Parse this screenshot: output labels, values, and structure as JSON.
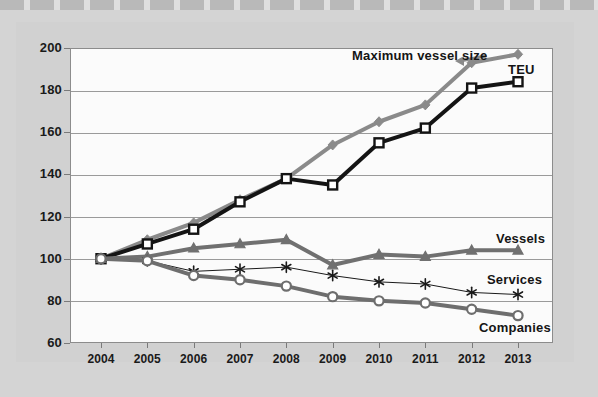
{
  "figure": {
    "annotations": [
      {
        "text": "Maximum vessel size",
        "x": 352,
        "y": 48
      },
      {
        "text": "TEU",
        "x": 508,
        "y": 62
      },
      {
        "text": "Vessels",
        "x": 496,
        "y": 231
      },
      {
        "text": "Services",
        "x": 487,
        "y": 272
      },
      {
        "text": "Companies",
        "x": 479,
        "y": 320
      }
    ]
  },
  "chart_data": {
    "type": "line",
    "title": "",
    "subtitle": "",
    "xlabel": "",
    "ylabel": "",
    "grid": true,
    "legend_position": "inline-annotations",
    "x": [
      2004,
      2005,
      2006,
      2007,
      2008,
      2009,
      2010,
      2011,
      2012,
      2013
    ],
    "categories": [
      "2004",
      "2005",
      "2006",
      "2007",
      "2008",
      "2009",
      "2010",
      "2011",
      "2012",
      "2013"
    ],
    "xlim": [
      2004,
      2013
    ],
    "ylim": [
      60,
      200
    ],
    "ytick_values": [
      60,
      80,
      100,
      120,
      140,
      160,
      180,
      200
    ],
    "ytick_labels": [
      "60",
      "80",
      "100",
      "120",
      "140",
      "160",
      "180",
      "200"
    ],
    "series": [
      {
        "name": "Maximum vessel size",
        "color": "#8a8a8a",
        "marker": "diamond",
        "line_width": 4,
        "values": [
          100,
          109,
          117,
          128,
          138,
          154,
          165,
          173,
          193,
          197
        ]
      },
      {
        "name": "TEU",
        "color": "#141414",
        "marker": "square",
        "line_width": 4,
        "values": [
          100,
          107,
          114,
          127,
          138,
          135,
          155,
          162,
          181,
          184
        ]
      },
      {
        "name": "Vessels",
        "color": "#707070",
        "marker": "triangle",
        "line_width": 4,
        "values": [
          100,
          101,
          105,
          107,
          109,
          97,
          102,
          101,
          104,
          104
        ]
      },
      {
        "name": "Services",
        "color": "#1a1a1a",
        "marker": "asterisk",
        "line_width": 1,
        "values": [
          100,
          99,
          94,
          95,
          96,
          92,
          89,
          88,
          84,
          83
        ]
      },
      {
        "name": "Companies",
        "color": "#6e6e6e",
        "marker": "circle",
        "line_width": 4,
        "values": [
          100,
          99,
          92,
          90,
          87,
          82,
          80,
          79,
          76,
          73
        ]
      }
    ]
  }
}
